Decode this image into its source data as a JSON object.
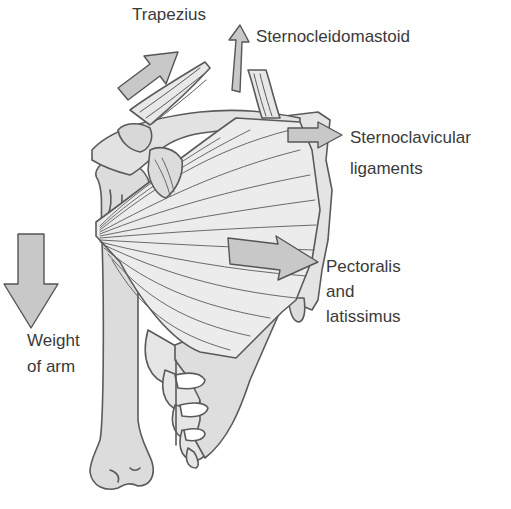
{
  "diagram": {
    "colors": {
      "arrow_fill": "#c8c8c8",
      "arrow_stroke": "#555555",
      "bone_fill": "#dcdcdc",
      "muscle_fill": "#e2e2e2",
      "line": "#5a5a5a",
      "text": "#3a3a3a",
      "background": "#ffffff"
    },
    "labels": {
      "trapezius": "Trapezius",
      "sternocleidomastoid": "Sternocleidomastoid",
      "sternoclavicular_1": "Sternoclavicular",
      "sternoclavicular_2": "ligaments",
      "pectoralis_1": "Pectoralis",
      "pectoralis_2": "and",
      "pectoralis_3": "latissimus",
      "weight_1": "Weight",
      "weight_2": "of arm"
    },
    "arrows": [
      {
        "name": "trapezius-arrow",
        "direction": "up-right"
      },
      {
        "name": "sternocleidomastoid-arrow",
        "direction": "up"
      },
      {
        "name": "sternoclavicular-arrow",
        "direction": "right"
      },
      {
        "name": "pectoralis-latissimus-arrow",
        "direction": "right-down"
      },
      {
        "name": "weight-of-arm-arrow",
        "direction": "down"
      }
    ]
  }
}
